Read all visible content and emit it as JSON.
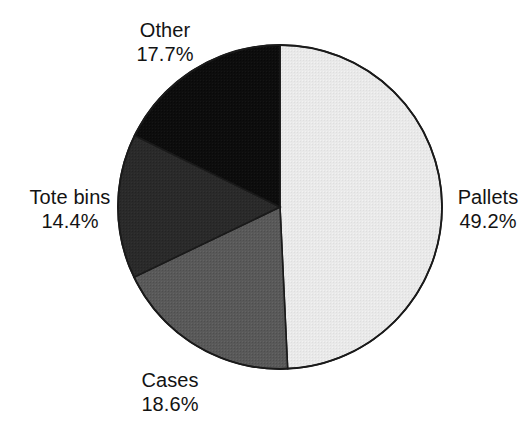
{
  "chart_data": {
    "type": "pie",
    "title": "",
    "subtitle": "",
    "xlabel": "",
    "ylabel": "",
    "grid": false,
    "legend_position": "none",
    "label_format": "name and percentage on two lines, placed outside the pie",
    "start_angle_deg": 0,
    "direction": "clockwise",
    "units": "percent",
    "total": 99.9,
    "categories": [
      "Pallets",
      "Cases",
      "Tote bins",
      "Other"
    ],
    "values": [
      49.2,
      18.6,
      14.4,
      17.7
    ],
    "slices": [
      {
        "label": "Pallets",
        "value": 49.2,
        "value_text": "49.2%",
        "color": "#e8e8e8",
        "fill_description": "very light gray halftone"
      },
      {
        "label": "Cases",
        "value": 18.6,
        "value_text": "18.6%",
        "color": "#5a5a5a",
        "fill_description": "medium gray halftone"
      },
      {
        "label": "Tote bins",
        "value": 14.4,
        "value_text": "14.4%",
        "color": "#2a2a2a",
        "fill_description": "dark charcoal halftone"
      },
      {
        "label": "Other",
        "value": 17.7,
        "value_text": "17.7%",
        "color": "#0d0d0d",
        "fill_description": "near black"
      }
    ],
    "outline_color": "#1a1a1a",
    "background_color": "#ffffff",
    "text_color": "#131313"
  },
  "labels": {
    "pallets": {
      "name": "Pallets",
      "value": "49.2%"
    },
    "cases": {
      "name": "Cases",
      "value": "18.6%"
    },
    "tote_bins": {
      "name": "Tote bins",
      "value": "14.4%"
    },
    "other": {
      "name": "Other",
      "value": "17.7%"
    }
  }
}
